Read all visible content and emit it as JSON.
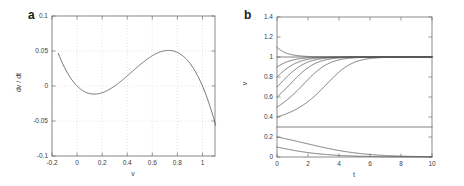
{
  "figure": {
    "panels": [
      {
        "letter": "a",
        "xlabel": "v",
        "ylabel": "dv / dt",
        "xticks": [
          "-0.2",
          "0",
          "0.2",
          "0.4",
          "0.6",
          "0.8",
          "1"
        ],
        "yticks": [
          "0.1",
          "0.05",
          "0",
          "-0.05",
          "-0.1"
        ]
      },
      {
        "letter": "b",
        "xlabel": "t",
        "ylabel": "v",
        "xticks": [
          "0",
          "2",
          "4",
          "6",
          "8",
          "10"
        ],
        "yticks": [
          "0",
          "0.2",
          "0.4",
          "0.6",
          "0.8",
          "1",
          "1.2",
          "1.4"
        ]
      }
    ]
  },
  "chart_data": [
    {
      "type": "line",
      "panel": "a",
      "title": "",
      "xlabel": "v",
      "ylabel": "dv / dt",
      "xlim": [
        -0.2,
        1.1
      ],
      "ylim": [
        -0.1,
        0.1
      ],
      "xticks": [
        -0.2,
        0,
        0.2,
        0.4,
        0.6,
        0.8,
        1
      ],
      "yticks": [
        -0.1,
        -0.05,
        0,
        0.05,
        0.1
      ],
      "grid": true,
      "legend": "none",
      "function": "f(v) = v (v - 0.3) (1 - v)",
      "roots": [
        0,
        0.3,
        1
      ],
      "local_minimum": {
        "v": 0.13,
        "dvdt": -0.018
      },
      "local_maximum": {
        "v": 0.72,
        "dvdt": 0.085
      },
      "series": [
        {
          "name": "dv/dt",
          "x": [
            -0.15,
            -0.125,
            -0.1,
            -0.075,
            -0.05,
            -0.025,
            0,
            0.025,
            0.05,
            0.075,
            0.1,
            0.125,
            0.15,
            0.175,
            0.2,
            0.225,
            0.25,
            0.275,
            0.3,
            0.325,
            0.35,
            0.375,
            0.4,
            0.425,
            0.45,
            0.475,
            0.5,
            0.525,
            0.55,
            0.575,
            0.6,
            0.625,
            0.65,
            0.675,
            0.7,
            0.725,
            0.75,
            0.775,
            0.8,
            0.825,
            0.85,
            0.875,
            0.9,
            0.925,
            0.95,
            0.975,
            1,
            1.025,
            1.05,
            1.075,
            1.1
          ],
          "y": [
            0.0776,
            0.0612,
            0.0473,
            0.0356,
            0.026,
            0.0182,
            0.0,
            -0.0069,
            -0.0123,
            -0.0163,
            -0.019,
            -0.0205,
            -0.0207,
            -0.02,
            -0.0182,
            -0.0156,
            -0.0122,
            -0.008,
            -0.0031,
            0.0024,
            0.0086,
            0.0152,
            0.0222,
            0.0296,
            0.0372,
            0.045,
            0.0529,
            0.0608,
            0.0687,
            0.0764,
            0.0839,
            0.0911,
            0.0978,
            0.1041,
            0.1097,
            0.1147,
            0.1189,
            0.1222,
            0.1245,
            0.1257,
            0.1259,
            0.1247,
            0.1223,
            0.1185,
            0.1132,
            0.1064,
            0.0,
            -0.0098,
            -0.0262,
            -0.0458,
            -0.0688
          ]
        }
      ],
      "note": "Displayed curve is a vertically scaled cubic with zeros at v=0, 0.3, 1; local min about -0.018 near v=0.13 and local max about 0.085 near v=0.72."
    },
    {
      "type": "line",
      "panel": "b",
      "title": "",
      "xlabel": "t",
      "ylabel": "v",
      "xlim": [
        0,
        10
      ],
      "ylim": [
        0,
        1.4
      ],
      "xticks": [
        0,
        2,
        4,
        6,
        8,
        10
      ],
      "yticks": [
        0,
        0.2,
        0.4,
        0.6,
        0.8,
        1,
        1.2,
        1.4
      ],
      "grid": false,
      "legend": "none",
      "stable_equilibria": [
        0,
        1
      ],
      "unstable_equilibrium": 0.3,
      "initial_conditions": [
        1.1,
        1.0,
        0.9,
        0.8,
        0.7,
        0.6,
        0.5,
        0.4,
        0.3,
        0.2,
        0.1
      ],
      "series": [
        {
          "name": "v0 = 1.1",
          "initial_value": 1.1,
          "final_value": 1.0,
          "t": [
            0,
            0.5,
            1,
            1.5,
            2,
            2.5,
            3,
            3.5,
            4,
            5,
            6,
            7,
            8,
            9,
            10
          ],
          "v": [
            1.1,
            1.069,
            1.048,
            1.034,
            1.024,
            1.017,
            1.012,
            1.008,
            1.006,
            1.003,
            1.001,
            1.0005,
            1.0002,
            1.0001,
            1.0
          ]
        },
        {
          "name": "v0 = 1.0",
          "initial_value": 1.0,
          "final_value": 1.0,
          "t": [
            0,
            1,
            2,
            3,
            4,
            5,
            6,
            7,
            8,
            9,
            10
          ],
          "v": [
            1.0,
            1.0,
            1.0,
            1.0,
            1.0,
            1.0,
            1.0,
            1.0,
            1.0,
            1.0,
            1.0
          ]
        },
        {
          "name": "v0 = 0.9",
          "initial_value": 0.9,
          "final_value": 0.999,
          "t": [
            0,
            0.5,
            1,
            1.5,
            2,
            2.5,
            3,
            3.5,
            4,
            5,
            6,
            7,
            8,
            9,
            10
          ],
          "v": [
            0.9,
            0.929,
            0.951,
            0.966,
            0.977,
            0.984,
            0.989,
            0.993,
            0.995,
            0.998,
            0.999,
            0.9995,
            0.9998,
            0.9999,
            1.0
          ]
        },
        {
          "name": "v0 = 0.8",
          "initial_value": 0.8,
          "final_value": 0.998,
          "t": [
            0,
            0.5,
            1,
            1.5,
            2,
            2.5,
            3,
            3.5,
            4,
            5,
            6,
            7,
            8,
            9,
            10
          ],
          "v": [
            0.8,
            0.849,
            0.889,
            0.919,
            0.941,
            0.958,
            0.97,
            0.979,
            0.985,
            0.993,
            0.997,
            0.9985,
            0.9993,
            0.9997,
            0.9999
          ]
        },
        {
          "name": "v0 = 0.7",
          "initial_value": 0.7,
          "final_value": 0.997,
          "t": [
            0,
            0.5,
            1,
            1.5,
            2,
            2.5,
            3,
            3.5,
            4,
            5,
            6,
            7,
            8,
            9,
            10
          ],
          "v": [
            0.7,
            0.757,
            0.812,
            0.86,
            0.898,
            0.928,
            0.95,
            0.966,
            0.977,
            0.99,
            0.996,
            0.998,
            0.999,
            0.9996,
            0.9998
          ]
        },
        {
          "name": "v0 = 0.6",
          "initial_value": 0.6,
          "final_value": 0.995,
          "t": [
            0,
            0.5,
            1,
            1.5,
            2,
            2.5,
            3,
            3.5,
            4,
            5,
            6,
            7,
            8,
            9,
            10
          ],
          "v": [
            0.6,
            0.653,
            0.71,
            0.767,
            0.819,
            0.864,
            0.9,
            0.928,
            0.948,
            0.975,
            0.988,
            0.994,
            0.997,
            0.9985,
            0.9993
          ]
        },
        {
          "name": "v0 = 0.5",
          "initial_value": 0.5,
          "final_value": 0.988,
          "t": [
            0,
            0.5,
            1,
            1.5,
            2,
            2.5,
            3,
            3.5,
            4,
            5,
            6,
            7,
            8,
            9,
            10
          ],
          "v": [
            0.5,
            0.54,
            0.587,
            0.64,
            0.695,
            0.748,
            0.797,
            0.84,
            0.876,
            0.929,
            0.961,
            0.979,
            0.988,
            0.994,
            0.997
          ]
        },
        {
          "name": "v0 = 0.4",
          "initial_value": 0.4,
          "final_value": 0.96,
          "t": [
            0,
            0.5,
            1,
            1.5,
            2,
            2.5,
            3,
            3.5,
            4,
            5,
            6,
            7,
            8,
            9,
            10
          ],
          "v": [
            0.4,
            0.418,
            0.441,
            0.47,
            0.505,
            0.545,
            0.59,
            0.637,
            0.685,
            0.774,
            0.846,
            0.898,
            0.933,
            0.956,
            0.971
          ]
        },
        {
          "name": "v0 = 0.3 (unstable equilibrium)",
          "initial_value": 0.3,
          "final_value": 0.3,
          "t": [
            0,
            1,
            2,
            3,
            4,
            5,
            6,
            7,
            8,
            9,
            10
          ],
          "v": [
            0.3,
            0.3,
            0.3,
            0.3,
            0.3,
            0.3,
            0.3,
            0.3,
            0.3,
            0.3,
            0.3
          ]
        },
        {
          "name": "v0 = 0.2",
          "initial_value": 0.2,
          "final_value": 0.04,
          "t": [
            0,
            0.5,
            1,
            1.5,
            2,
            2.5,
            3,
            3.5,
            4,
            5,
            6,
            7,
            8,
            9,
            10
          ],
          "v": [
            0.2,
            0.194,
            0.188,
            0.181,
            0.174,
            0.167,
            0.16,
            0.152,
            0.144,
            0.128,
            0.111,
            0.094,
            0.078,
            0.061,
            0.045
          ]
        },
        {
          "name": "v0 = 0.1",
          "initial_value": 0.1,
          "final_value": 0.01,
          "t": [
            0,
            0.5,
            1,
            1.5,
            2,
            2.5,
            3,
            3.5,
            4,
            5,
            6,
            7,
            8,
            9,
            10
          ],
          "v": [
            0.1,
            0.0965,
            0.093,
            0.0894,
            0.0857,
            0.0819,
            0.078,
            0.074,
            0.07,
            0.0615,
            0.0527,
            0.0435,
            0.0341,
            0.0243,
            0.0142
          ]
        }
      ],
      "note": "Trajectories of dv/dt = v(v-0.3)(1-v): initial values above 0.3 rise toward v=1, below 0.3 decay toward v=0, and v=0.3 stays constant."
    }
  ]
}
